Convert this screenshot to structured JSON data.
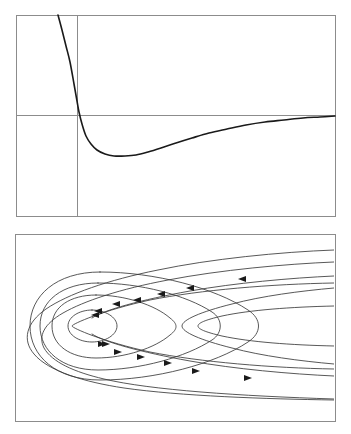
{
  "figure": {
    "title": "",
    "background_color": "#ffffff",
    "width": 351,
    "height": 434,
    "panel_count": 2
  },
  "chart_data": [
    {
      "type": "line",
      "panel": "top",
      "title": "",
      "subtitle": "",
      "xlabel": "",
      "ylabel": "",
      "grid": false,
      "legend": null,
      "axis_style": "crossed-axes-inside-frame",
      "frame": {
        "x": 16,
        "y": 15,
        "width": 319,
        "height": 201
      },
      "axes": {
        "horizontal_axis_y_px": 115,
        "vertical_axis_x_px": 77,
        "origin_px": [
          77,
          115
        ]
      },
      "xlim": [
        0,
        1
      ],
      "ylim": [
        -1,
        1.6
      ],
      "annotations": [
        "curve descends steeply from top-left",
        "crosses horizontal axis at the vertical axis line",
        "reaches minimum near x=0.34",
        "rises asymptotically toward the horizontal axis at right"
      ],
      "series": [
        {
          "name": "potential",
          "color": "#1a1a1a",
          "points_px": [
            [
              58,
              15
            ],
            [
              62,
              30
            ],
            [
              66,
              46
            ],
            [
              70,
              62
            ],
            [
              74,
              84
            ],
            [
              77,
              101
            ],
            [
              79,
              112
            ],
            [
              82,
              124
            ],
            [
              86,
              136
            ],
            [
              91,
              144
            ],
            [
              97,
              150
            ],
            [
              105,
              154
            ],
            [
              114,
              156
            ],
            [
              125,
              156
            ],
            [
              136,
              155
            ],
            [
              148,
              152
            ],
            [
              161,
              148
            ],
            [
              176,
              143
            ],
            [
              192,
              138
            ],
            [
              209,
              133
            ],
            [
              227,
              129
            ],
            [
              246,
              125
            ],
            [
              265,
              122
            ],
            [
              284,
              120
            ],
            [
              303,
              118
            ],
            [
              320,
              117
            ],
            [
              335,
              116
            ]
          ],
          "minimum_px": [
            122,
            156
          ],
          "zero_crossing_px": [
            77,
            115
          ]
        }
      ]
    },
    {
      "type": "line",
      "panel": "bottom",
      "title": "",
      "subtitle": "",
      "xlabel": "",
      "ylabel": "",
      "grid": false,
      "legend": null,
      "axis_style": "frame-only",
      "frame": {
        "x": 15,
        "y": 234,
        "width": 320,
        "height": 187
      },
      "description": "streamline plot of a recirculating vortex with nested closed orbits and open streamlines",
      "vortex_center_px": [
        92,
        326
      ],
      "closed_contours": 3,
      "open_contours": 3,
      "flow_direction": "clockwise",
      "arrow_count": 14,
      "annotations": [
        "innermost closed orbit encircles the vortex center",
        "nested closed streamlines widen toward a cusp on the right",
        "outer open streamlines enter and exit the right edge",
        "arrows point left above the center and right below the center"
      ]
    }
  ],
  "panels": [
    {
      "name": "potential-energy-panel",
      "index": 1
    },
    {
      "name": "streamline-panel",
      "index": 2
    }
  ]
}
